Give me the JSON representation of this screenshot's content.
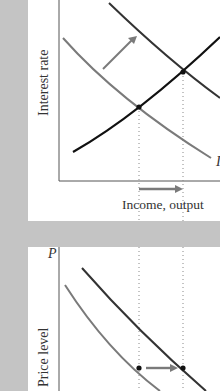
{
  "top_chart": {
    "y_axis_label": "Interest rate",
    "x_axis_label": "Income, output",
    "curve_label_is": "I",
    "curves": [
      {
        "name": "IS_initial",
        "color": "#7a7a7a"
      },
      {
        "name": "IS_shifted",
        "color": "#333333"
      },
      {
        "name": "LM",
        "color": "#111111"
      }
    ],
    "shift_arrow_direction": "up-right",
    "output_arrow_direction": "right"
  },
  "bottom_chart": {
    "y_axis_label": "Price level",
    "y_axis_symbol": "P",
    "curves": [
      {
        "name": "AD_initial",
        "color": "#7a7a7a"
      },
      {
        "name": "AD_shifted",
        "color": "#333333"
      }
    ],
    "shift_arrow_direction": "right"
  },
  "colors": {
    "background_gray": "#c4c4c4",
    "panel_white": "#ffffff",
    "arrow_gray": "#7a7a7a"
  }
}
